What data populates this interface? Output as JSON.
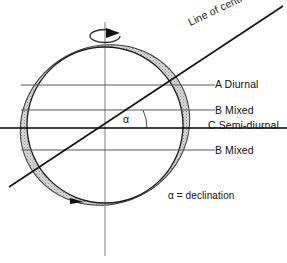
{
  "diagram": {
    "labels": {
      "line_of_centres": "Line of centres",
      "band_a": "A  Diurnal",
      "band_b_upper": "B  Mixed",
      "band_c": "C  Semi-diurnal",
      "band_b_lower": "B  Mixed",
      "declination_note": "α = declination",
      "angle_symbol": "α"
    },
    "geometry": {
      "circle_center_x": 105,
      "circle_center_y": 125,
      "circle_radius": 80,
      "declination_angle_deg": 25.5,
      "rotation_axis_top_y": 22,
      "rotation_axis_bottom_y": 256,
      "latitude_line_a_y": 85,
      "latitude_line_b_upper_y": 110,
      "latitude_line_c_y": 128,
      "latitude_line_b_lower_y": 150
    },
    "colors": {
      "outline": "#1a1a1a",
      "bulge_fill": "#c9c9c9",
      "latitude_line": "#555555",
      "equator_line": "#000000",
      "axis_line": "#777777",
      "background": "#ffffff"
    },
    "icons": {
      "rotation_arrow": "rotation-arrow-icon"
    }
  }
}
